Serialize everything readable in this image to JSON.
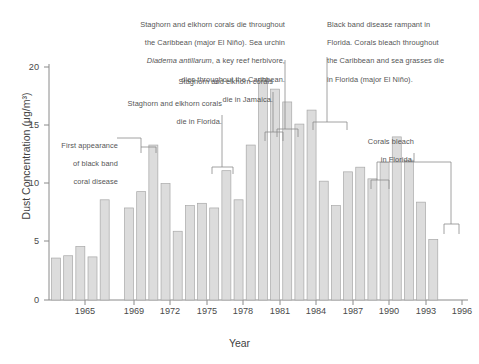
{
  "chart_data": {
    "type": "bar",
    "title": "",
    "xlabel": "Year",
    "ylabel": "Dust Concentration (μg/m³)",
    "ylim": [
      0,
      20
    ],
    "yticks": [
      0,
      5,
      10,
      15,
      20
    ],
    "xticks": [
      1965,
      1969,
      1972,
      1975,
      1978,
      1981,
      1984,
      1987,
      1990,
      1993,
      1996
    ],
    "grid": false,
    "legend": null,
    "bar_color": "#dcdcdc",
    "bar_edge_color": "#a8a8a8",
    "axis_color": "#777777",
    "categories": [
      1963,
      1964,
      1965,
      1966,
      1967,
      1969,
      1970,
      1971,
      1972,
      1973,
      1974,
      1975,
      1976,
      1977,
      1978,
      1979,
      1980,
      1981,
      1982,
      1983,
      1984,
      1985,
      1986,
      1987,
      1988,
      1989,
      1990,
      1991,
      1992,
      1993,
      1994,
      1995,
      1996
    ],
    "values": [
      3.6,
      3.8,
      4.6,
      3.7,
      8.6,
      7.9,
      9.3,
      13.3,
      10.0,
      5.9,
      8.1,
      8.3,
      7.9,
      11.1,
      8.6,
      13.3,
      19.0,
      18.1,
      17.0,
      15.1,
      16.3,
      10.2,
      8.1,
      11.0,
      11.4,
      10.4,
      11.8,
      14.0,
      12.0,
      8.4,
      5.2,
      0,
      0
    ],
    "series": [
      {
        "name": "Dust Concentration",
        "points": [
          {
            "year": 1963,
            "value": 3.6
          },
          {
            "year": 1964,
            "value": 3.8
          },
          {
            "year": 1965,
            "value": 4.6
          },
          {
            "year": 1966,
            "value": 3.7
          },
          {
            "year": 1967,
            "value": 8.6
          },
          {
            "year": 1969,
            "value": 7.9
          },
          {
            "year": 1970,
            "value": 9.3
          },
          {
            "year": 1971,
            "value": 13.3
          },
          {
            "year": 1972,
            "value": 10.0
          },
          {
            "year": 1973,
            "value": 5.9
          },
          {
            "year": 1974,
            "value": 8.1
          },
          {
            "year": 1975,
            "value": 8.3
          },
          {
            "year": 1976,
            "value": 7.9
          },
          {
            "year": 1977,
            "value": 11.1
          },
          {
            "year": 1978,
            "value": 8.6
          },
          {
            "year": 1979,
            "value": 13.3
          },
          {
            "year": 1980,
            "value": 19.0
          },
          {
            "year": 1981,
            "value": 18.1
          },
          {
            "year": 1982,
            "value": 17.0
          },
          {
            "year": 1983,
            "value": 15.1
          },
          {
            "year": 1984,
            "value": 16.3
          },
          {
            "year": 1985,
            "value": 10.2
          },
          {
            "year": 1986,
            "value": 8.1
          },
          {
            "year": 1987,
            "value": 11.0
          },
          {
            "year": 1988,
            "value": 11.4
          },
          {
            "year": 1989,
            "value": 10.4
          },
          {
            "year": 1990,
            "value": 11.8
          },
          {
            "year": 1991,
            "value": 14.0
          },
          {
            "year": 1992,
            "value": 12.0
          },
          {
            "year": 1993,
            "value": 8.4
          },
          {
            "year": 1994,
            "value": 5.2
          }
        ]
      }
    ],
    "annotations": [
      {
        "id": "first-appearance-black-band",
        "text": "First appearance\nof black band\ncoral disease"
      },
      {
        "id": "staghorn-elkhorn-florida",
        "text": "Staghorn and elkhorn corals\ndie in Florida."
      },
      {
        "id": "staghorn-elkhorn-jamaica",
        "text": "Staghorn and elkhorn corals\ndie in Jamaica."
      },
      {
        "id": "staghorn-elkhorn-caribbean",
        "line1": "Staghorn and elkhorn corals die throughout",
        "line2": "the Caribbean (major El Niño). Sea urchin",
        "species": "Diadema antillarum",
        "line3": ", a key reef herbivore,",
        "line4": "dies throughout the Caribbean."
      },
      {
        "id": "black-band-rampant-florida",
        "text": "Black band disease rampant in\nFlorida. Corals bleach throughout\nthe Caribbean and sea grasses die\nin Florida (major El Niño)."
      },
      {
        "id": "corals-bleach-florida",
        "text": "Corals bleach\nin Florida."
      }
    ]
  },
  "axis": {
    "ylabel": "Dust Concentration (μg/m³)",
    "xlabel": "Year",
    "yticks": [
      "20",
      "15",
      "10",
      "5",
      "0"
    ],
    "xticks": [
      "1965",
      "1969",
      "1972",
      "1975",
      "1978",
      "1981",
      "1984",
      "1987",
      "1990",
      "1993",
      "1996"
    ]
  },
  "annotations": {
    "a1_l1": "First appearance",
    "a1_l2": "of black band",
    "a1_l3": "coral disease",
    "a2_l1": "Staghorn and elkhorn corals",
    "a2_l2": "die in Florida.",
    "a3_l1": "Staghorn and elkhorn corals",
    "a3_l2": "die in Jamaica.",
    "a4_l1": "Staghorn and elkhorn corals die throughout",
    "a4_l2": "the Caribbean (major El Niño). Sea urchin",
    "a4_species": "Diadema antillarum",
    "a4_l3tail": ", a key reef herbivore,",
    "a4_l4": "dies throughout the Caribbean.",
    "a5_l1": "Black band disease rampant in",
    "a5_l2": "Florida. Corals bleach throughout",
    "a5_l3": "the Caribbean and sea grasses die",
    "a5_l4": "in Florida (major El Niño).",
    "a6_l1": "Corals bleach",
    "a6_l2": "in Florida."
  }
}
